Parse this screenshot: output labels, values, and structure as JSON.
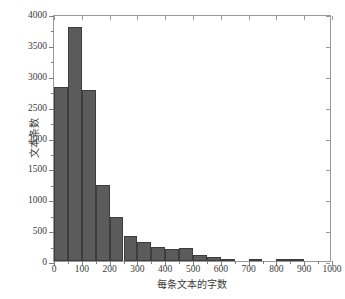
{
  "chart_data": {
    "type": "bar",
    "title": "",
    "subtitle": "",
    "xlabel": "每条文本的字数",
    "ylabel": "文本条数",
    "xlim": [
      0,
      1000
    ],
    "ylim": [
      0,
      4000
    ],
    "xticks": [
      0,
      100,
      200,
      300,
      400,
      500,
      600,
      700,
      800,
      900,
      1000
    ],
    "xtick_labels": [
      "0",
      "100",
      "200",
      "300",
      "400",
      "500",
      "600",
      "700",
      "800",
      "900",
      "1000"
    ],
    "yticks": [
      0,
      500,
      1000,
      1500,
      2000,
      2500,
      3000,
      3500,
      4000
    ],
    "ytick_labels": [
      "0",
      "500",
      "1000",
      "1500",
      "2000",
      "2500",
      "3000",
      "3500",
      "4000"
    ],
    "grid": false,
    "legend": null,
    "bin_width": 50,
    "bar_color": "#5b5b5b",
    "bar_edge_color": "#3d3d3d",
    "axis_color": "#9a9a9a",
    "background": "#ffffff",
    "categories": [
      "25",
      "75",
      "125",
      "175",
      "225",
      "275",
      "325",
      "375",
      "425",
      "475",
      "525",
      "575",
      "625",
      "675",
      "725",
      "775",
      "825",
      "875",
      "925"
    ],
    "bin_starts": [
      0,
      50,
      100,
      150,
      200,
      250,
      300,
      350,
      400,
      450,
      500,
      550,
      600,
      650,
      700,
      750,
      800,
      850,
      900
    ],
    "bin_ends": [
      50,
      100,
      150,
      200,
      250,
      300,
      350,
      400,
      450,
      500,
      550,
      600,
      650,
      700,
      750,
      800,
      850,
      900,
      950
    ],
    "values": [
      2820,
      3790,
      2770,
      1230,
      720,
      410,
      305,
      225,
      200,
      215,
      105,
      60,
      40,
      0,
      30,
      0,
      20,
      20,
      0
    ]
  }
}
